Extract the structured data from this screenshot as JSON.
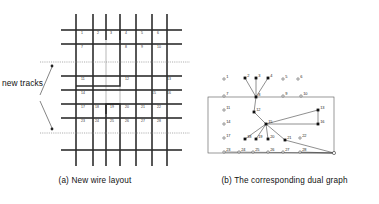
{
  "figure": {
    "panels": [
      {
        "id": "a",
        "caption": "(a) New wire layout"
      },
      {
        "id": "b",
        "caption": "(b) The corresponding dual graph"
      }
    ],
    "annotations": {
      "new_tracks": "new tracks",
      "outer_face": "outer face"
    }
  },
  "layout": {
    "grid": {
      "x0": 61,
      "y0": 14,
      "x1": 182,
      "y1": 166,
      "v_lines": [
        76,
        93,
        106,
        120,
        136,
        152,
        167
      ],
      "h_lines": [
        30,
        44,
        62,
        76,
        90,
        104,
        118,
        132,
        150
      ],
      "new_track_y": [
        62,
        133
      ],
      "cell_numbers": [
        {
          "n": "1",
          "x": 81,
          "y": 34
        },
        {
          "n": "2",
          "x": 97,
          "y": 34
        },
        {
          "n": "3",
          "x": 110,
          "y": 34
        },
        {
          "n": "4",
          "x": 125,
          "y": 34
        },
        {
          "n": "5",
          "x": 141,
          "y": 34
        },
        {
          "n": "6",
          "x": 157,
          "y": 34
        },
        {
          "n": "7",
          "x": 81,
          "y": 48
        },
        {
          "n": "8",
          "x": 125,
          "y": 48
        },
        {
          "n": "9",
          "x": 141,
          "y": 48
        },
        {
          "n": "10",
          "x": 157,
          "y": 48
        },
        {
          "n": "11",
          "x": 81,
          "y": 80
        },
        {
          "n": "12",
          "x": 125,
          "y": 80
        },
        {
          "n": "13",
          "x": 167,
          "y": 80
        },
        {
          "n": "14",
          "x": 81,
          "y": 94
        },
        {
          "n": "15",
          "x": 152,
          "y": 94
        },
        {
          "n": "16",
          "x": 167,
          "y": 94
        },
        {
          "n": "17",
          "x": 81,
          "y": 108
        },
        {
          "n": "18",
          "x": 95,
          "y": 108
        },
        {
          "n": "19",
          "x": 110,
          "y": 108
        },
        {
          "n": "20",
          "x": 125,
          "y": 108
        },
        {
          "n": "21",
          "x": 141,
          "y": 108
        },
        {
          "n": "22",
          "x": 157,
          "y": 108
        },
        {
          "n": "23",
          "x": 81,
          "y": 122
        },
        {
          "n": "24",
          "x": 95,
          "y": 122
        },
        {
          "n": "25",
          "x": 110,
          "y": 122
        },
        {
          "n": "26",
          "x": 125,
          "y": 122
        },
        {
          "n": "27",
          "x": 141,
          "y": 122
        },
        {
          "n": "28",
          "x": 157,
          "y": 122
        }
      ]
    },
    "dual": {
      "frame": {
        "x": 208,
        "y": 97,
        "w": 126,
        "h": 56
      },
      "outer_node": {
        "x": 334,
        "y": 153
      },
      "nodes": [
        {
          "n": "1",
          "x": 224,
          "y": 79,
          "filled": false
        },
        {
          "n": "2",
          "x": 245,
          "y": 78,
          "filled": true
        },
        {
          "n": "3",
          "x": 256,
          "y": 78,
          "filled": true
        },
        {
          "n": "4",
          "x": 268,
          "y": 78,
          "filled": true
        },
        {
          "n": "5",
          "x": 283,
          "y": 79,
          "filled": false
        },
        {
          "n": "6",
          "x": 298,
          "y": 79,
          "filled": false
        },
        {
          "n": "7",
          "x": 224,
          "y": 96,
          "filled": false
        },
        {
          "n": "8",
          "x": 256,
          "y": 97,
          "filled": true
        },
        {
          "n": "9",
          "x": 283,
          "y": 96,
          "filled": false
        },
        {
          "n": "10",
          "x": 301,
          "y": 96,
          "filled": false
        },
        {
          "n": "11",
          "x": 224,
          "y": 110,
          "filled": false
        },
        {
          "n": "12",
          "x": 254,
          "y": 112,
          "filled": true
        },
        {
          "n": "13",
          "x": 318,
          "y": 110,
          "filled": true
        },
        {
          "n": "14",
          "x": 224,
          "y": 124,
          "filled": false
        },
        {
          "n": "15",
          "x": 266,
          "y": 124,
          "filled": true
        },
        {
          "n": "16",
          "x": 318,
          "y": 124,
          "filled": true
        },
        {
          "n": "17",
          "x": 224,
          "y": 138,
          "filled": false
        },
        {
          "n": "18",
          "x": 245,
          "y": 139,
          "filled": true
        },
        {
          "n": "19",
          "x": 256,
          "y": 139,
          "filled": true
        },
        {
          "n": "20",
          "x": 268,
          "y": 139,
          "filled": true
        },
        {
          "n": "21",
          "x": 285,
          "y": 140,
          "filled": true
        },
        {
          "n": "22",
          "x": 300,
          "y": 138,
          "filled": false
        },
        {
          "n": "23",
          "x": 224,
          "y": 152,
          "filled": false
        },
        {
          "n": "24",
          "x": 239,
          "y": 152,
          "filled": false
        },
        {
          "n": "25",
          "x": 253,
          "y": 152,
          "filled": false
        },
        {
          "n": "26",
          "x": 268,
          "y": 152,
          "filled": false
        },
        {
          "n": "27",
          "x": 283,
          "y": 152,
          "filled": false
        },
        {
          "n": "28",
          "x": 300,
          "y": 152,
          "filled": false
        }
      ],
      "edges": [
        [
          "2",
          "8"
        ],
        [
          "3",
          "8"
        ],
        [
          "4",
          "8"
        ],
        [
          "8",
          "12"
        ],
        [
          "12",
          "15"
        ],
        [
          "15",
          "13"
        ],
        [
          "15",
          "16"
        ],
        [
          "13",
          "16"
        ],
        [
          "15",
          "18"
        ],
        [
          "15",
          "19"
        ],
        [
          "15",
          "20"
        ],
        [
          "15",
          "21"
        ],
        [
          "23",
          "outer"
        ],
        [
          "28",
          "outer"
        ],
        [
          "21",
          "outer"
        ]
      ]
    }
  }
}
